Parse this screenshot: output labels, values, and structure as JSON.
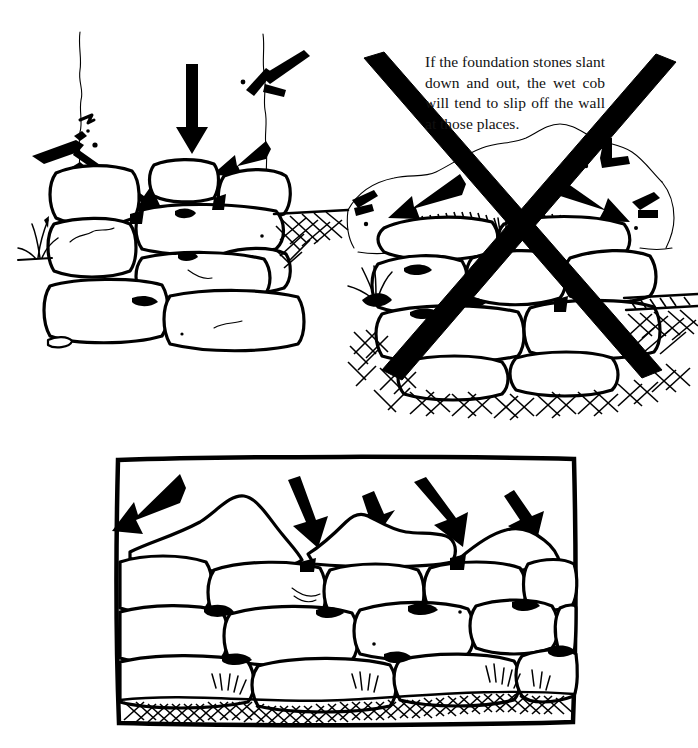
{
  "page": {
    "background_color": "#ffffff",
    "ink_color": "#000000",
    "width": 698,
    "height": 748,
    "top_cut_text": ""
  },
  "caption": {
    "text": "If the foundation stones slant down and out, the wet cob will tend to slip off the wall at those places."
  },
  "figures": [
    {
      "id": "fig-good-foundation",
      "name": "good-foundation-drawing",
      "description": "Hand drawn stone foundation wall with stones sloping inward, three bold arrows pressing down and inward onto the top course, cob wall above, earth hatching at right, tuft of grass at left.",
      "arrow_count": 3,
      "marked_invalid": false
    },
    {
      "id": "fig-bad-foundation",
      "name": "bad-foundation-drawing",
      "description": "Hand drawn stone foundation wall whose top stones slant down and out; two bold arrows point outward, wet cob slumps over the edges; the whole drawing is crossed out with a large bold X.",
      "arrow_count": 2,
      "marked_invalid": true
    },
    {
      "id": "fig-wall-section",
      "name": "wall-section-drawing",
      "description": "Framed rectangular panel showing a dry stone wall section with five bold arrows angled down onto the uneven top course, grass and ground hatching along the base.",
      "arrow_count": 5,
      "marked_invalid": false,
      "has_frame": true
    }
  ],
  "annotations": {
    "x_mark_label": "crossed-out",
    "arrow_label": "load-arrow"
  }
}
